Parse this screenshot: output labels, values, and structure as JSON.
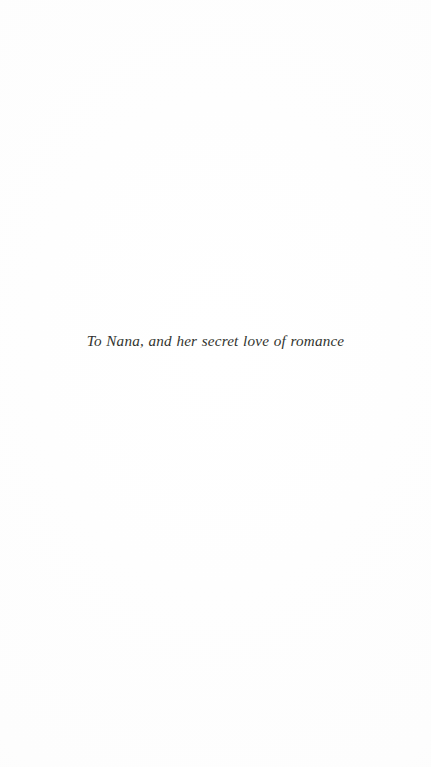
{
  "page": {
    "kind": "book-dedication-page",
    "background_color": "#fefefe",
    "width": 431,
    "height": 767
  },
  "dedication": {
    "text": "To Nana, and her secret love of romance",
    "color": "#231f20",
    "alignment": "center"
  }
}
